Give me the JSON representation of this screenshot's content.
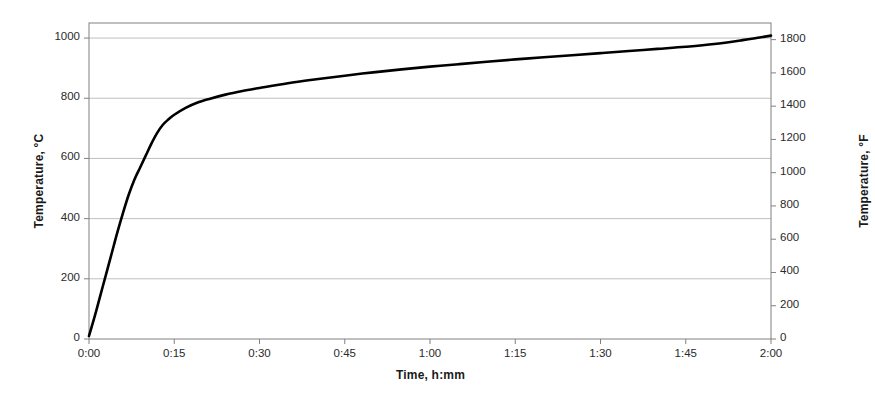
{
  "chart_data": {
    "type": "line",
    "title": "",
    "xlabel": "Time, h:mm",
    "ylabel": "Temperature, °C",
    "ylabel_secondary": "Temperature, °F",
    "grid": true,
    "legend": "none",
    "line_color": "#000000",
    "grid_color": "#bfbfbf",
    "axis_color": "#808080",
    "xlim": [
      0,
      120
    ],
    "ylim": [
      0,
      1050
    ],
    "ylim_secondary": [
      0,
      1900
    ],
    "x_tick_labels": [
      "0:00",
      "0:15",
      "0:30",
      "0:45",
      "1:00",
      "1:15",
      "1:30",
      "1:45",
      "2:00"
    ],
    "x_tick_values": [
      0,
      15,
      30,
      45,
      60,
      75,
      90,
      105,
      120
    ],
    "y_tick_labels": [
      "0",
      "200",
      "400",
      "600",
      "800",
      "1000"
    ],
    "y_tick_values": [
      0,
      200,
      400,
      600,
      800,
      1000
    ],
    "y2_tick_labels": [
      "0",
      "200",
      "400",
      "600",
      "800",
      "1000",
      "1200",
      "1400",
      "1600",
      "1800"
    ],
    "y2_tick_values": [
      0,
      200,
      400,
      600,
      800,
      1000,
      1200,
      1400,
      1600,
      1800
    ],
    "series": [
      {
        "name": "Furnace temperature",
        "x": [
          0,
          1,
          2,
          3,
          4,
          5,
          6,
          7,
          8,
          9,
          10,
          11,
          12,
          13,
          14,
          15,
          17,
          19,
          21,
          24,
          27,
          30,
          35,
          40,
          45,
          50,
          55,
          60,
          65,
          70,
          75,
          80,
          85,
          90,
          95,
          100,
          105,
          110,
          115,
          118,
          120
        ],
        "values": [
          10,
          75,
          145,
          215,
          285,
          355,
          420,
          480,
          530,
          570,
          610,
          650,
          685,
          712,
          730,
          745,
          768,
          785,
          797,
          812,
          824,
          834,
          850,
          863,
          875,
          886,
          896,
          905,
          913,
          921,
          929,
          936,
          943,
          950,
          957,
          964,
          971,
          980,
          993,
          1002,
          1008
        ]
      }
    ]
  }
}
